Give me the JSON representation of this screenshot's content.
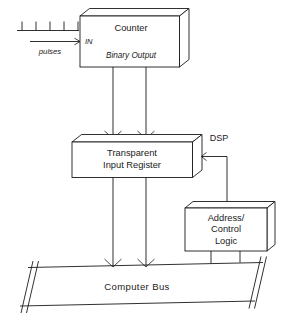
{
  "diagram": {
    "blocks": [
      {
        "id": "counter",
        "label": "Counter",
        "port_in": "IN",
        "port_out": "Binary Output"
      },
      {
        "id": "register",
        "label_line1": "Transparent",
        "label_line2": "Input Register"
      },
      {
        "id": "address_control",
        "label_line1": "Address/",
        "label_line2": "Control",
        "label_line3": "Logic"
      },
      {
        "id": "bus",
        "label": "Computer   Bus"
      }
    ],
    "signals": [
      {
        "id": "pulses",
        "label": "pulses"
      },
      {
        "id": "dsp",
        "label": "DSP"
      }
    ],
    "pulse_count": 5,
    "colors": {
      "line": "#1a1a1a",
      "fill": "#ffffff",
      "background": "#ffffff"
    }
  }
}
